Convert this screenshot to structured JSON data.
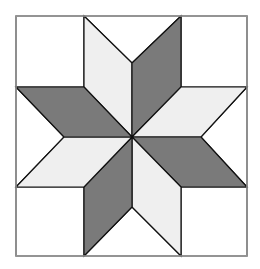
{
  "diagram": {
    "type": "quilt-block",
    "pattern": "eight-pointed-star",
    "colors": {
      "background": "#ffffff",
      "light": "#efefef",
      "dark": "#7a7a7a",
      "stroke": "#111111",
      "border": "#999999"
    },
    "frame": {
      "x": 16,
      "y": 16,
      "width": 231,
      "height": 240
    },
    "corner_squares": [
      {
        "name": "top-left",
        "points": "16,16 84,16 84,87 16,87"
      },
      {
        "name": "top-right",
        "points": "181,16 247,16 247,87 181,87"
      },
      {
        "name": "bottom-right",
        "points": "181,187 247,187 247,256 181,256"
      },
      {
        "name": "bottom-left",
        "points": "16,187 84,187 84,256 16,256"
      }
    ],
    "edge_triangles": [
      {
        "name": "top",
        "points": "84,16 181,16 132,63"
      },
      {
        "name": "right",
        "points": "247,87 247,187 201,137"
      },
      {
        "name": "bottom",
        "points": "84,256 181,256 132,207"
      },
      {
        "name": "left",
        "points": "16,87 16,187 64,137"
      }
    ],
    "diamonds": [
      {
        "name": "top-left",
        "shade": "light",
        "points": "84,16 132,63 132,137 84,87"
      },
      {
        "name": "top-right",
        "shade": "dark",
        "points": "181,16 181,87 132,137 132,63"
      },
      {
        "name": "right-top",
        "shade": "light",
        "points": "247,87 201,137 132,137 181,87"
      },
      {
        "name": "right-bottom",
        "shade": "dark",
        "points": "247,187 181,187 132,137 201,137"
      },
      {
        "name": "bottom-right",
        "shade": "light",
        "points": "181,256 132,207 132,137 181,187"
      },
      {
        "name": "bottom-left",
        "shade": "dark",
        "points": "84,256 84,187 132,137 132,207"
      },
      {
        "name": "left-bottom",
        "shade": "light",
        "points": "16,187 64,137 132,137 84,187"
      },
      {
        "name": "left-top",
        "shade": "dark",
        "points": "16,87 84,87 132,137 64,137"
      }
    ]
  }
}
